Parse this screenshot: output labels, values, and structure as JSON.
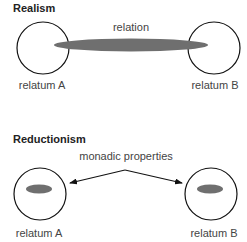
{
  "realism": {
    "title": "Realism",
    "relation_label": "relation",
    "relatum_a": "relatum A",
    "relatum_b": "relatum B"
  },
  "reductionism": {
    "title": "Reductionism",
    "properties_label": "monadic properties",
    "relatum_a": "relatum A",
    "relatum_b": "relatum B"
  },
  "colors": {
    "ellipse_fill": "#6f6f6f",
    "stroke": "#111111"
  }
}
